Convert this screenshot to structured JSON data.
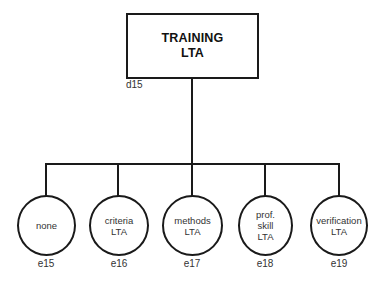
{
  "diagram": {
    "type": "tree",
    "root": {
      "id": "d15",
      "title_lines": [
        "TRAINING",
        "LTA"
      ]
    },
    "children": [
      {
        "id": "e15",
        "label_lines": [
          "none"
        ]
      },
      {
        "id": "e16",
        "label_lines": [
          "criteria",
          "LTA"
        ]
      },
      {
        "id": "e17",
        "label_lines": [
          "methods",
          "LTA"
        ]
      },
      {
        "id": "e18",
        "label_lines": [
          "prof.",
          "skill",
          "LTA"
        ]
      },
      {
        "id": "e19",
        "label_lines": [
          "verification",
          "LTA"
        ]
      }
    ],
    "colors": {
      "line": "#1a1a1a",
      "text": "#333333",
      "background": "#ffffff"
    }
  }
}
